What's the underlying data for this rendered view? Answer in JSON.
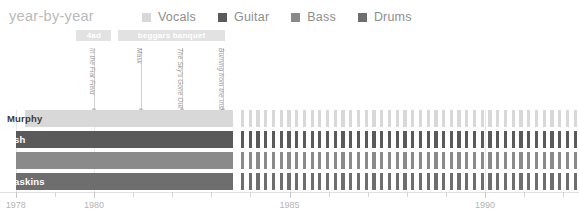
{
  "header": {
    "title": "year-by-year"
  },
  "legend": {
    "items": [
      {
        "label": "Vocals",
        "color": "#d8d8d8"
      },
      {
        "label": "Guitar",
        "color": "#5a5a5a"
      },
      {
        "label": "Bass",
        "color": "#8a8a8a"
      },
      {
        "label": "Drums",
        "color": "#6e6e6e"
      }
    ]
  },
  "eras": [
    {
      "label": "4ad",
      "start": 1979.55,
      "end": 1980.45,
      "color": "#e2e2e2"
    },
    {
      "label": "beggars banquet",
      "start": 1980.62,
      "end": 1983.35,
      "color": "#e2e2e2"
    }
  ],
  "annotations": [
    {
      "label": "In the Flat Field",
      "year": 1980.0
    },
    {
      "label": "Mask",
      "year": 1981.2
    },
    {
      "label": "The Sky's Gone Out",
      "year": 1982.25
    },
    {
      "label": "Burning from the Inside",
      "year": 1983.3
    }
  ],
  "rows": [
    {
      "name": "Murphy",
      "role": "Vocals",
      "color": "#d8d8d8",
      "label_color": "#3b3b3b"
    },
    {
      "name": "Ash",
      "role": "Guitar",
      "color": "#5a5a5a",
      "label_color": "#ffffff"
    },
    {
      "name": "J",
      "role": "Bass",
      "color": "#8a8a8a",
      "label_color": "#ffffff"
    },
    {
      "name": "Haskins",
      "role": "Drums",
      "color": "#6e6e6e",
      "label_color": "#ffffff"
    }
  ],
  "chart_data": {
    "type": "timeline",
    "title": "year-by-year",
    "xlabel": "",
    "ylabel": "",
    "xlim": [
      1977.6,
      1992.4
    ],
    "grid": true,
    "legend_position": "top",
    "tick_labels": [
      "1978",
      "1980",
      "1985",
      "1990"
    ],
    "tick_values": [
      1978,
      1980,
      1985,
      1990
    ],
    "minor_tick_values": [
      1979,
      1981,
      1982,
      1983,
      1984,
      1986,
      1987,
      1988,
      1989,
      1991,
      1992
    ],
    "categories": [
      "Murphy",
      "Ash",
      "J",
      "Haskins"
    ],
    "series": [
      {
        "name": "Murphy",
        "role": "Vocals",
        "color": "#d8d8d8",
        "solid_spans": [
          [
            1978.25,
            1983.55
          ]
        ],
        "striped_span": [
          1983.7,
          1992.4
        ],
        "stripe_count": 44
      },
      {
        "name": "Ash",
        "role": "Guitar",
        "color": "#5a5a5a",
        "solid_spans": [
          [
            1978.0,
            1983.55
          ]
        ],
        "striped_span": [
          1983.7,
          1992.4
        ],
        "stripe_count": 44
      },
      {
        "name": "J",
        "role": "Bass",
        "color": "#8a8a8a",
        "solid_spans": [
          [
            1978.0,
            1983.55
          ]
        ],
        "striped_span": [
          1983.7,
          1992.4
        ],
        "stripe_count": 44
      },
      {
        "name": "Haskins",
        "role": "Drums",
        "color": "#6e6e6e",
        "solid_spans": [
          [
            1978.0,
            1983.55
          ]
        ],
        "striped_span": [
          1983.7,
          1992.4
        ],
        "stripe_count": 44
      }
    ]
  }
}
